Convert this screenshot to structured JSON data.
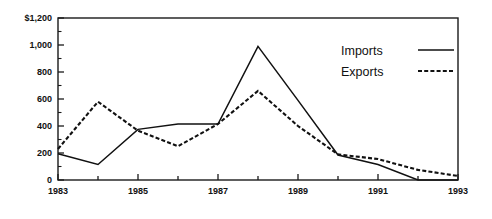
{
  "chart_data": {
    "type": "line",
    "title": "",
    "subtitle": "",
    "xlabel": "",
    "ylabel": "",
    "x": [
      1983,
      1984,
      1985,
      1986,
      1987,
      1988,
      1989,
      1990,
      1991,
      1992,
      1993
    ],
    "xlim": [
      1983,
      1993
    ],
    "ylim": [
      0,
      1200
    ],
    "grid": false,
    "legend_position": "top-right",
    "x_tick_values": [
      1983,
      1984,
      1985,
      1986,
      1987,
      1988,
      1989,
      1990,
      1991,
      1992,
      1993
    ],
    "x_tick_labels": [
      "1983",
      "",
      "1985",
      "",
      "1987",
      "",
      "1989",
      "",
      "1991",
      "",
      "1993"
    ],
    "y_tick_values": [
      0,
      200,
      400,
      600,
      800,
      1000,
      1200
    ],
    "y_tick_labels": [
      "0",
      "200",
      "400",
      "600",
      "800",
      "1,000",
      "$1,200"
    ],
    "y_minor_tick_values": [
      100,
      300,
      500,
      700,
      900,
      1100
    ],
    "series": [
      {
        "name": "Imports",
        "style": "solid",
        "values": [
          195,
          115,
          375,
          415,
          415,
          990,
          590,
          185,
          115,
          0,
          0
        ]
      },
      {
        "name": "Exports",
        "style": "dotted",
        "values": [
          230,
          580,
          365,
          250,
          415,
          660,
          400,
          190,
          155,
          75,
          30
        ]
      }
    ]
  },
  "legend": {
    "entries": [
      {
        "label": "Imports",
        "style": "solid"
      },
      {
        "label": "Exports",
        "style": "dotted"
      }
    ]
  },
  "colors": {
    "ink": "#111111",
    "background": "#ffffff"
  }
}
